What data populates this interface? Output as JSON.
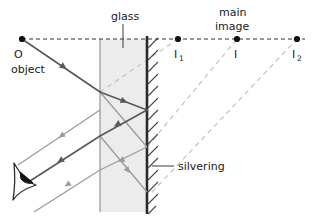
{
  "figure": {
    "canvas": {
      "width": 312,
      "height": 216,
      "background": "#ffffff"
    }
  },
  "colors": {
    "ray_dark": "#5a5a5a",
    "ray_light": "#9b9b9b",
    "dashed_gray": "#bdbdbd",
    "axis_dash": "#333333",
    "glass_fill": "#ececec",
    "glass_edge": "#8a8a8a",
    "silvering": "#2b2b2b",
    "hatch": "#4a4a4a",
    "text": "#1a1a1a",
    "point_dot": "#111111",
    "eye_outline": "#2b2b2b",
    "eye_pupil": "#111111"
  },
  "labels": {
    "glass": "glass",
    "main": "main",
    "image": "image",
    "silvering": "silvering",
    "object_letter": "O",
    "object_word": "object",
    "image1_letter": "I",
    "image1_sub": "1",
    "image_main_letter": "I",
    "image2_letter": "I",
    "image2_sub": "2"
  },
  "points": [
    {
      "name": "object-point-O",
      "label": "O",
      "x": 22,
      "y": 39
    },
    {
      "name": "image-point-I1",
      "label": "I1",
      "x": 178,
      "y": 39
    },
    {
      "name": "image-point-I",
      "label": "I",
      "x": 237,
      "y": 39
    },
    {
      "name": "image-point-I2",
      "label": "I2",
      "x": 297,
      "y": 39
    }
  ],
  "geometry": {
    "optical_axis_y": 39,
    "axis_x_start": 22,
    "axis_x_end": 305,
    "glass_front_x": 100,
    "glass_back_x": 147,
    "glass_top_y": 39,
    "glass_bottom_y": 212,
    "silvering_x": 147,
    "hatch_count": 15,
    "glass_leader_x": 123,
    "glass_leader_y_top": 25,
    "glass_leader_y_bottom": 48,
    "silvering_leader_x1": 152,
    "silvering_leader_x2": 173,
    "silvering_leader_y": 165
  },
  "rays": {
    "incident": {
      "name": "incident-ray-from-object",
      "from": [
        22,
        39
      ],
      "to": [
        100,
        92
      ],
      "style": "dark-solid",
      "arrow_at": 0.55
    },
    "refracted_in_glass": {
      "name": "refracted-ray-in-glass",
      "from": [
        100,
        92
      ],
      "to": [
        147,
        110
      ],
      "style": "dark-solid",
      "arrow_at": 0.6
    },
    "reflected_in_glass": {
      "name": "reflected-ray-in-glass",
      "from": [
        147,
        110
      ],
      "to": [
        100,
        136
      ],
      "style": "dark-solid",
      "arrow_at": 0.6
    },
    "exit_main": {
      "name": "exit-ray-to-eye",
      "from": [
        100,
        136
      ],
      "to": [
        32,
        182
      ],
      "style": "dark-solid",
      "arrow_at": 0.55
    },
    "partial_internal_1": {
      "name": "partial-internal-ray-upper",
      "from": [
        100,
        92
      ],
      "to": [
        147,
        147
      ],
      "style": "light-solid"
    },
    "secondary_exit_upper": {
      "name": "secondary-exit-ray-upper",
      "from": [
        100,
        110
      ],
      "to": [
        20,
        164
      ],
      "style": "light-solid",
      "arrow_at": 0.5
    },
    "secondary_exit_lower": {
      "name": "secondary-exit-ray-lower",
      "from": [
        100,
        170
      ],
      "to": [
        36,
        212
      ],
      "style": "light-solid",
      "arrow_at": 0.55
    },
    "internal_second": {
      "name": "second-internal-bounce",
      "from": [
        147,
        147
      ],
      "to": [
        100,
        170
      ],
      "style": "light-solid",
      "arrow_at": 0.6
    }
  },
  "virtual_rays": [
    {
      "name": "virtual-ray-to-I1",
      "from": [
        100,
        92
      ],
      "to": [
        178,
        39
      ],
      "style": "dashed-gray"
    },
    {
      "name": "virtual-ray-to-I",
      "from": [
        147,
        147
      ],
      "to": [
        237,
        39
      ],
      "style": "dashed-gray"
    },
    {
      "name": "virtual-ray-to-I2",
      "from": [
        150,
        190
      ],
      "to": [
        297,
        39
      ],
      "style": "dashed-gray"
    }
  ],
  "eye": {
    "name": "observer-eye",
    "x": 28,
    "y": 182,
    "description": "eye symbol viewing the emergent rays"
  }
}
